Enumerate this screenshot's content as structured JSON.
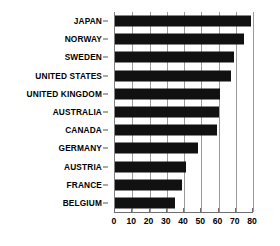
{
  "chart_data": {
    "type": "bar",
    "orientation": "horizontal",
    "title": "",
    "xlabel": "",
    "ylabel": "",
    "categories": [
      "JAPAN",
      "NORWAY",
      "SWEDEN",
      "UNITED STATES",
      "UNITED KINGDOM",
      "AUSTRALIA",
      "CANADA",
      "GERMANY",
      "AUSTRIA",
      "FRANCE",
      "BELGIUM"
    ],
    "values": [
      79,
      75,
      69,
      67,
      61,
      60,
      59,
      48,
      41,
      39,
      35
    ],
    "xlim": [
      0,
      80
    ],
    "xticks": [
      0,
      10,
      20,
      30,
      40,
      50,
      60,
      70,
      80
    ],
    "xtick_labels": [
      "0",
      "10",
      "20",
      "30",
      "40",
      "50",
      "60",
      "70",
      "80"
    ],
    "grid": true,
    "grid_axis": "x",
    "legend": false,
    "bar_color": "#111111",
    "grid_color": "#9a9a9a",
    "axis_color": "#6e6e6e",
    "background": "#ffffff"
  }
}
